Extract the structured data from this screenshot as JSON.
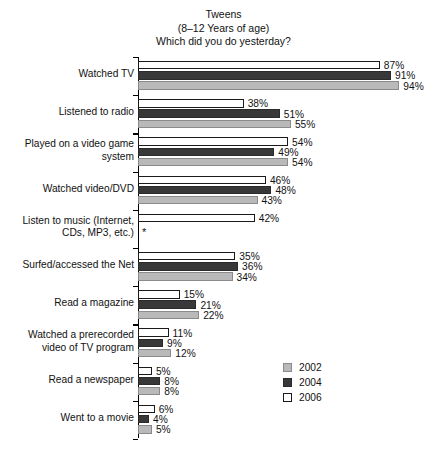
{
  "chart_data": {
    "type": "bar",
    "orientation": "horizontal",
    "title": "Tweens\n(8–12 Years of age)\nWhich did you do yesterday?",
    "title_lines": [
      "Tweens",
      "(8–12 Years of age)",
      "Which did you do yesterday?"
    ],
    "xlabel": "",
    "ylabel": "",
    "xlim": [
      0,
      100
    ],
    "grid": false,
    "value_suffix": "%",
    "legend_position": "bottom-right",
    "categories": [
      "Watched TV",
      "Listened to radio",
      "Played on a video game system",
      "Watched video/DVD",
      "Listen to music (Internet, CDs, MP3, etc.)",
      "Surfed/accessed the Net",
      "Read a magazine",
      "Watched a prerecorded video of TV program",
      "Read a newspaper",
      "Went to a movie"
    ],
    "category_label_lines": [
      [
        "Watched TV"
      ],
      [
        "Listened to radio"
      ],
      [
        "Played on a video game",
        "system"
      ],
      [
        "Watched video/DVD"
      ],
      [
        "Listen to music (Internet,",
        "CDs, MP3, etc.)"
      ],
      [
        "Surfed/accessed the Net"
      ],
      [
        "Read a magazine"
      ],
      [
        "Watched a prerecorded",
        "video of TV program"
      ],
      [
        "Read a newspaper"
      ],
      [
        "Went to a movie"
      ]
    ],
    "series": [
      {
        "name": "2006",
        "color": "#ffffff",
        "values": [
          87,
          38,
          54,
          46,
          42,
          35,
          15,
          11,
          5,
          6
        ],
        "labels": [
          "87%",
          "38%",
          "54%",
          "46%",
          "42%",
          "35%",
          "15%",
          "11%",
          "5%",
          "6%"
        ]
      },
      {
        "name": "2004",
        "color": "#383838",
        "values": [
          91,
          51,
          49,
          48,
          null,
          36,
          21,
          9,
          8,
          4
        ],
        "labels": [
          "91%",
          "51%",
          "49%",
          "48%",
          "",
          "36%",
          "21%",
          "9%",
          "8%",
          "4%"
        ]
      },
      {
        "name": "2002",
        "color": "#b9b9b9",
        "values": [
          94,
          55,
          54,
          43,
          null,
          34,
          22,
          12,
          8,
          5
        ],
        "labels": [
          "94%",
          "55%",
          "54%",
          "43%",
          "",
          "34%",
          "22%",
          "12%",
          "8%",
          "5%"
        ]
      }
    ],
    "annotations": [
      {
        "text": "*",
        "category": "Listen to music (Internet, CDs, MP3, etc.)",
        "note": "marker where 2004 and 2002 data are not available"
      }
    ]
  },
  "legend": {
    "entries": [
      {
        "label": "2002",
        "color": "#b9b9b9"
      },
      {
        "label": "2004",
        "color": "#383838"
      },
      {
        "label": "2006",
        "color": "#ffffff"
      }
    ]
  }
}
